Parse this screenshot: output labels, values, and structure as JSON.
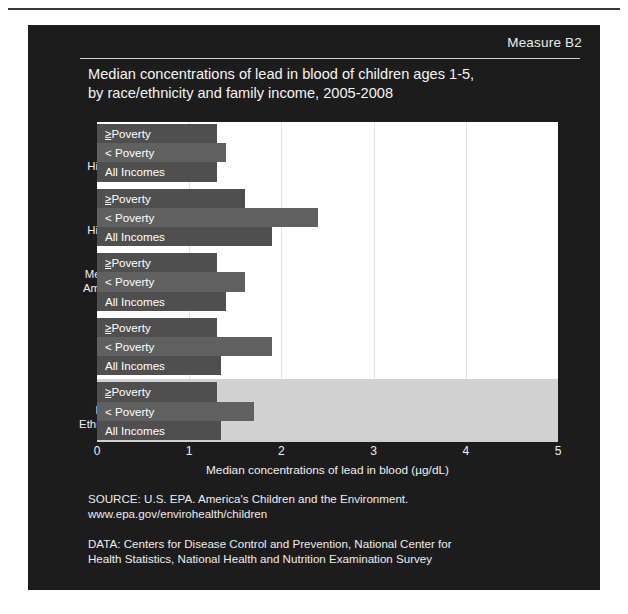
{
  "slide": {
    "measure_label": "Measure B2",
    "title_line1": "Median concentrations of lead in blood of children ages 1-5,",
    "title_line2": "by race/ethnicity and family income, 2005-2008",
    "source_line1": "SOURCE: U.S. EPA. America's Children and the Environment.",
    "source_line2": "www.epa.gov/envirohealth/children",
    "data_line1": "DATA: Centers for Disease Control and Prevention, National Center for",
    "data_line2": "Health Statistics, National Health and Nutrition Examination Survey"
  },
  "colors": {
    "panel_background": "#1c1c1c",
    "plot_background": "#ffffff",
    "bar_primary": "#4f4f4f",
    "bar_alt": "#606060",
    "last_group_band": "#d2d2d2",
    "text": "#f2f2f2",
    "gridline": "#e2e2e2"
  },
  "chart_data": {
    "type": "bar",
    "orientation": "horizontal",
    "title": "Median concentrations of lead in blood of children ages 1-5, by race/ethnicity and family income, 2005-2008",
    "xlabel": "Median concentrations of lead in blood (µg/dL)",
    "ylabel": "",
    "xlim": [
      0,
      5
    ],
    "xticks": [
      0,
      1,
      2,
      3,
      4,
      5
    ],
    "xticklabels": [
      "0",
      "1",
      "2",
      "3",
      "4",
      "5"
    ],
    "grid": true,
    "legend": "none",
    "groups": [
      {
        "label_lines": [
          "White",
          "non-",
          "Hispanic"
        ],
        "label": "White non-Hispanic",
        "highlight": false,
        "bars": [
          {
            "label": "≥ Poverty",
            "underline_first": true,
            "value": 1.3
          },
          {
            "label": "< Poverty",
            "underline_first": false,
            "value": 1.4
          },
          {
            "label": "All Incomes",
            "underline_first": false,
            "value": 1.3
          }
        ]
      },
      {
        "label_lines": [
          "Black",
          "non-",
          "Hispanic"
        ],
        "label": "Black non-Hispanic",
        "highlight": false,
        "bars": [
          {
            "label": "≥ Poverty",
            "underline_first": true,
            "value": 1.6
          },
          {
            "label": "< Poverty",
            "underline_first": false,
            "value": 2.4
          },
          {
            "label": "All Incomes",
            "underline_first": false,
            "value": 1.9
          }
        ]
      },
      {
        "label_lines": [
          "Mexican-",
          "American"
        ],
        "label": "Mexican-American",
        "highlight": false,
        "bars": [
          {
            "label": "≥ Poverty",
            "underline_first": true,
            "value": 1.3
          },
          {
            "label": "< Poverty",
            "underline_first": false,
            "value": 1.6
          },
          {
            "label": "All Incomes",
            "underline_first": false,
            "value": 1.4
          }
        ]
      },
      {
        "label_lines": [
          "Other"
        ],
        "label": "Other",
        "highlight": false,
        "bars": [
          {
            "label": "≥ Poverty",
            "underline_first": true,
            "value": 1.3
          },
          {
            "label": "< Poverty",
            "underline_first": false,
            "value": 1.9
          },
          {
            "label": "All Incomes",
            "underline_first": false,
            "value": 1.35
          }
        ]
      },
      {
        "label_lines": [
          "All",
          "Races/",
          "Ethnicities"
        ],
        "label": "All Races/Ethnicities",
        "highlight": true,
        "bars": [
          {
            "label": "≥ Poverty",
            "underline_first": true,
            "value": 1.3
          },
          {
            "label": "< Poverty",
            "underline_first": false,
            "value": 1.7
          },
          {
            "label": "All Incomes",
            "underline_first": false,
            "value": 1.35
          }
        ]
      }
    ]
  }
}
